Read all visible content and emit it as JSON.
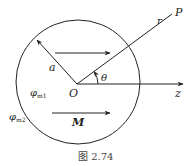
{
  "figure": {
    "caption": "图 2.74",
    "labels": {
      "P": "P",
      "r": "r",
      "a": "a",
      "theta": "θ",
      "O": "O",
      "z": "z",
      "M": "M",
      "phi1_base": "φ",
      "phi1_sub": "m1",
      "phi2_base": "φ",
      "phi2_sub": "m2"
    },
    "colors": {
      "stroke": "#222222",
      "caption": "#444444"
    }
  }
}
